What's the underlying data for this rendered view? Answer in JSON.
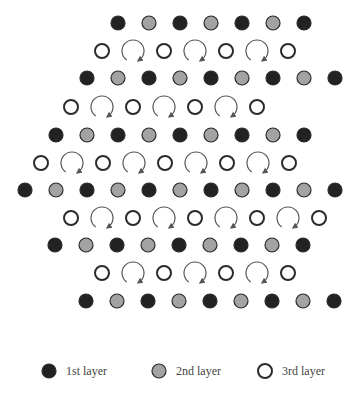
{
  "colors": {
    "layer1_fill": "#222222",
    "layer2_fill": "#a3a3a3",
    "layer3_fill": "#ffffff",
    "stroke": "#2a2a2a",
    "arrow": "#555555"
  },
  "dot_radius": 7,
  "spacing": 31,
  "rows": [
    {
      "y": 23,
      "type": "solid",
      "x_start": 118,
      "count": 7,
      "first": "layer1"
    },
    {
      "y": 51,
      "type": "open",
      "x_start": 102,
      "count": 4
    },
    {
      "y": 78,
      "type": "solid",
      "x_start": 87,
      "count": 9,
      "first": "layer1"
    },
    {
      "y": 107,
      "type": "open",
      "x_start": 71,
      "count": 4
    },
    {
      "y": 135,
      "type": "solid",
      "x_start": 56,
      "count": 9,
      "first": "layer1"
    },
    {
      "y": 163,
      "type": "open",
      "x_start": 41,
      "count": 5
    },
    {
      "y": 190,
      "type": "solid",
      "x_start": 25,
      "count": 11,
      "first": "layer1"
    },
    {
      "y": 218,
      "type": "open",
      "x_start": 71,
      "count": 5
    },
    {
      "y": 245,
      "type": "solid",
      "x_start": 55,
      "count": 9,
      "first": "layer1"
    },
    {
      "y": 273,
      "type": "open",
      "x_start": 102,
      "count": 4
    },
    {
      "y": 301,
      "type": "solid",
      "x_start": 86,
      "count": 9,
      "first": "layer1"
    }
  ],
  "legend": {
    "y": 371,
    "items": [
      {
        "label": "1st layer",
        "type": "layer1",
        "x": 49
      },
      {
        "label": "2nd layer",
        "type": "layer2",
        "x": 159
      },
      {
        "label": "3rd layer",
        "type": "layer3",
        "x": 265
      }
    ]
  }
}
